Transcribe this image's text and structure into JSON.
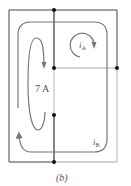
{
  "figure": {
    "caption": "(b)",
    "source_label": "7 A",
    "mesh_current_a": "i",
    "mesh_current_a_sub": "A",
    "mesh_current_b": "i",
    "mesh_current_b_sub": "B"
  },
  "colors": {
    "wire_dark": "#333333",
    "wire_light": "#aaaaaa",
    "loop": "#777777",
    "node": "#111111",
    "text": "#555555"
  }
}
